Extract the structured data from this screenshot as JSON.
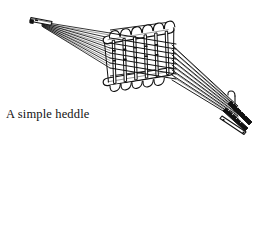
{
  "figure": {
    "title": "A simple heddle loom",
    "caption_text": "A simple heddle\nloom.",
    "caption_line_1": "A simple heddle",
    "caption_line_2": "loom.",
    "ink_color": "#111111",
    "background_color": "#ffffff",
    "line_art": {
      "subject": "simple heddle loom",
      "view": "three-quarter perspective",
      "parts": {
        "left_clamp_label": "warp clamp",
        "heddle_frame_label": "heddle frame",
        "top_bar_label": "top bar",
        "bottom_bar_label": "bottom bar",
        "heddle_bars_label": "heddle bars",
        "warp_threads_label": "warp threads",
        "right_bundle_label": "warp bundle",
        "hook_label": "hanging hook"
      },
      "counts": {
        "top_bar_loops": 6,
        "bottom_bar_loops": 5,
        "heddle_bars": 6,
        "warp_threads": 8
      },
      "geometry": {
        "left_clamp_x": 38,
        "left_clamp_y": 20,
        "frame_left_x": 108,
        "frame_right_x": 170,
        "frame_top_y": 22,
        "frame_bottom_y": 84,
        "right_bundle_x": 238,
        "right_bundle_y": 118
      }
    }
  }
}
